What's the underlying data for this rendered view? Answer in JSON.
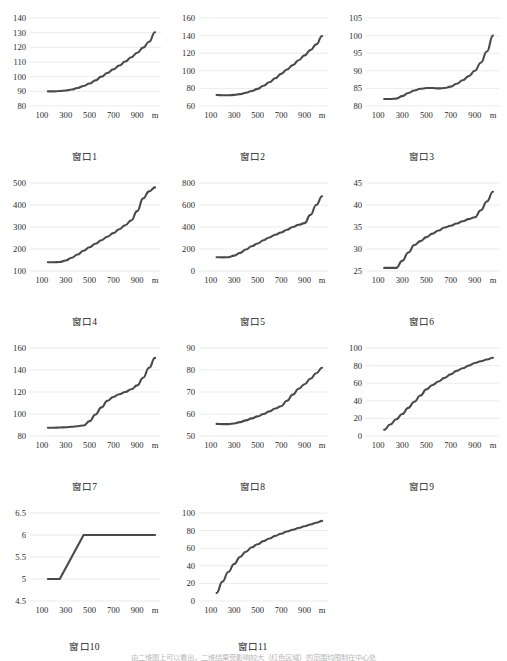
{
  "figure": {
    "unit_label": "m",
    "axis_x_ticks": [
      "100",
      "300",
      "500",
      "700",
      "900"
    ],
    "line_color": "#4a4a4a",
    "grid_color": "#e2e2e2",
    "footnote": "由二维图上可以看出，二维结果受影响较大（红色区域）的范围均限制在中心处"
  },
  "chart_data": [
    {
      "type": "line",
      "title": "窗口1",
      "xlabel": "m",
      "ylabel": "",
      "grid": true,
      "legend": "none",
      "xlim": [
        0,
        1100
      ],
      "ylim": [
        80,
        140
      ],
      "yticks": [
        80,
        90,
        100,
        110,
        120,
        130,
        140
      ],
      "xticks": [
        100,
        300,
        500,
        700,
        900
      ],
      "x": [
        150,
        200,
        250,
        300,
        350,
        400,
        450,
        500,
        550,
        600,
        650,
        700,
        750,
        800,
        850,
        900,
        950,
        1000,
        1050
      ],
      "values": [
        90.0,
        90.0,
        90.2,
        90.6,
        91.3,
        92.3,
        93.6,
        95.3,
        97.5,
        100.0,
        102.5,
        105.0,
        107.6,
        110.3,
        113.2,
        116.3,
        119.8,
        123.8,
        130.3
      ]
    },
    {
      "type": "line",
      "title": "窗口2",
      "xlabel": "m",
      "ylabel": "",
      "grid": true,
      "legend": "none",
      "xlim": [
        0,
        1100
      ],
      "ylim": [
        60,
        160
      ],
      "yticks": [
        60,
        80,
        100,
        120,
        140,
        160
      ],
      "xticks": [
        100,
        300,
        500,
        700,
        900
      ],
      "x": [
        150,
        200,
        250,
        300,
        350,
        400,
        450,
        500,
        550,
        600,
        650,
        700,
        750,
        800,
        850,
        900,
        950,
        1000,
        1050
      ],
      "values": [
        72.5,
        72.3,
        72.2,
        72.6,
        73.5,
        75.0,
        77.0,
        79.5,
        83.0,
        87.0,
        91.5,
        96.5,
        101.5,
        106.5,
        112.0,
        117.5,
        123.5,
        130.0,
        139.5
      ]
    },
    {
      "type": "line",
      "title": "窗口3",
      "xlabel": "m",
      "ylabel": "",
      "grid": true,
      "legend": "none",
      "xlim": [
        0,
        1100
      ],
      "ylim": [
        80,
        105
      ],
      "yticks": [
        80,
        85,
        90,
        95,
        100,
        105
      ],
      "xticks": [
        100,
        300,
        500,
        700,
        900
      ],
      "x": [
        150,
        200,
        250,
        300,
        350,
        400,
        450,
        500,
        550,
        600,
        650,
        700,
        750,
        800,
        850,
        900,
        950,
        1000,
        1050
      ],
      "values": [
        82.0,
        82.0,
        82.1,
        82.8,
        83.7,
        84.4,
        84.9,
        85.1,
        85.1,
        85.0,
        85.1,
        85.5,
        86.3,
        87.3,
        88.5,
        90.0,
        92.3,
        95.5,
        100.0
      ]
    },
    {
      "type": "line",
      "title": "窗口4",
      "xlabel": "m",
      "ylabel": "",
      "grid": true,
      "legend": "none",
      "xlim": [
        0,
        1100
      ],
      "ylim": [
        100,
        500
      ],
      "yticks": [
        100,
        200,
        300,
        400,
        500
      ],
      "xticks": [
        100,
        300,
        500,
        700,
        900
      ],
      "x": [
        150,
        200,
        250,
        300,
        350,
        400,
        450,
        500,
        550,
        600,
        650,
        700,
        750,
        800,
        850,
        900,
        950,
        1000,
        1050
      ],
      "values": [
        140,
        140,
        141,
        148,
        160,
        175,
        192,
        208,
        224,
        240,
        256,
        272,
        290,
        308,
        330,
        372,
        430,
        462,
        480
      ]
    },
    {
      "type": "line",
      "title": "窗口5",
      "xlabel": "m",
      "ylabel": "",
      "grid": true,
      "legend": "none",
      "xlim": [
        0,
        1100
      ],
      "ylim": [
        0,
        800
      ],
      "yticks": [
        0,
        200,
        400,
        600,
        800
      ],
      "xticks": [
        100,
        300,
        500,
        700,
        900
      ],
      "x": [
        150,
        200,
        250,
        300,
        350,
        400,
        450,
        500,
        550,
        600,
        650,
        700,
        750,
        800,
        850,
        900,
        950,
        1000,
        1050
      ],
      "values": [
        125,
        124,
        125,
        140,
        165,
        195,
        225,
        250,
        280,
        305,
        330,
        350,
        375,
        400,
        420,
        435,
        510,
        600,
        680
      ]
    },
    {
      "type": "line",
      "title": "窗口6",
      "xlabel": "m",
      "ylabel": "",
      "grid": true,
      "legend": "none",
      "xlim": [
        0,
        1100
      ],
      "ylim": [
        25,
        45
      ],
      "yticks": [
        25,
        30,
        35,
        40,
        45
      ],
      "xticks": [
        100,
        300,
        500,
        700,
        900
      ],
      "x": [
        150,
        200,
        250,
        300,
        350,
        400,
        450,
        500,
        550,
        600,
        650,
        700,
        750,
        800,
        850,
        900,
        950,
        1000,
        1050
      ],
      "values": [
        25.7,
        25.7,
        25.7,
        27.3,
        29.2,
        30.9,
        31.8,
        32.7,
        33.5,
        34.2,
        34.9,
        35.3,
        35.8,
        36.3,
        36.8,
        37.2,
        38.8,
        40.8,
        43.0
      ]
    },
    {
      "type": "line",
      "title": "窗口7",
      "xlabel": "m",
      "ylabel": "",
      "grid": true,
      "legend": "none",
      "xlim": [
        0,
        1100
      ],
      "ylim": [
        80,
        160
      ],
      "yticks": [
        80,
        100,
        120,
        140,
        160
      ],
      "xticks": [
        100,
        300,
        500,
        700,
        900
      ],
      "x": [
        150,
        200,
        250,
        300,
        350,
        400,
        450,
        500,
        550,
        600,
        650,
        700,
        750,
        800,
        850,
        900,
        950,
        1000,
        1050
      ],
      "values": [
        87.5,
        87.5,
        87.7,
        88.0,
        88.4,
        88.9,
        89.6,
        93.5,
        99.5,
        106.0,
        112.0,
        115.5,
        118.0,
        120.0,
        122.5,
        126.0,
        133.0,
        142.0,
        151.0
      ]
    },
    {
      "type": "line",
      "title": "窗口8",
      "xlabel": "m",
      "ylabel": "",
      "grid": true,
      "legend": "none",
      "xlim": [
        0,
        1100
      ],
      "ylim": [
        50,
        90
      ],
      "yticks": [
        50,
        60,
        70,
        80,
        90
      ],
      "xticks": [
        100,
        300,
        500,
        700,
        900
      ],
      "x": [
        150,
        200,
        250,
        300,
        350,
        400,
        450,
        500,
        550,
        600,
        650,
        700,
        750,
        800,
        850,
        900,
        950,
        1000,
        1050
      ],
      "values": [
        55.5,
        55.4,
        55.4,
        55.7,
        56.3,
        57.1,
        58.0,
        58.9,
        60.0,
        61.2,
        62.5,
        63.5,
        66.0,
        68.8,
        71.5,
        73.5,
        76.0,
        78.5,
        81.0
      ]
    },
    {
      "type": "line",
      "title": "窗口9",
      "xlabel": "m",
      "ylabel": "",
      "grid": true,
      "legend": "none",
      "xlim": [
        0,
        1100
      ],
      "ylim": [
        0,
        100
      ],
      "yticks": [
        0,
        20,
        40,
        60,
        80,
        100
      ],
      "xticks": [
        100,
        300,
        500,
        700,
        900
      ],
      "x": [
        150,
        200,
        250,
        300,
        350,
        400,
        450,
        500,
        550,
        600,
        650,
        700,
        750,
        800,
        850,
        900,
        950,
        1000,
        1050
      ],
      "values": [
        7,
        13,
        19,
        25,
        32,
        39,
        46,
        53,
        58,
        62,
        66,
        70,
        74,
        77,
        80,
        83,
        85,
        87,
        89
      ]
    },
    {
      "type": "line",
      "title": "窗口10",
      "xlabel": "m",
      "ylabel": "",
      "grid": true,
      "legend": "none",
      "xlim": [
        0,
        1100
      ],
      "ylim": [
        4.5,
        6.5
      ],
      "yticks": [
        4.5,
        5,
        5.5,
        6,
        6.5
      ],
      "xticks": [
        100,
        300,
        500,
        700,
        900
      ],
      "x": [
        150,
        200,
        250,
        300,
        350,
        400,
        450,
        500,
        550,
        600,
        650,
        700,
        750,
        800,
        850,
        900,
        950,
        1000,
        1050
      ],
      "values": [
        5,
        5,
        5,
        5.25,
        5.5,
        5.75,
        6,
        6,
        6,
        6,
        6,
        6,
        6,
        6,
        6,
        6,
        6,
        6,
        6
      ]
    },
    {
      "type": "line",
      "title": "窗口11",
      "xlabel": "m",
      "ylabel": "",
      "grid": true,
      "legend": "none",
      "xlim": [
        0,
        1100
      ],
      "ylim": [
        0,
        100
      ],
      "yticks": [
        0,
        20,
        40,
        60,
        80,
        100
      ],
      "xticks": [
        100,
        300,
        500,
        700,
        900
      ],
      "x": [
        150,
        200,
        250,
        300,
        350,
        400,
        450,
        500,
        550,
        600,
        650,
        700,
        750,
        800,
        850,
        900,
        950,
        1000,
        1050
      ],
      "values": [
        9,
        22,
        33,
        42,
        50,
        56,
        61,
        64.5,
        68,
        71,
        74,
        76.5,
        79,
        81,
        83,
        85,
        87,
        89,
        91
      ]
    }
  ]
}
